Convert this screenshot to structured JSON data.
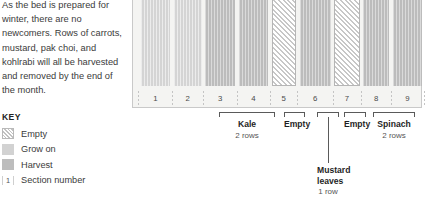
{
  "narrative": {
    "paragraph": "As the bed is prepared for winter, there are no newcomers. Rows of carrots, mustard, pak choi, and kohlrabi will all be harvested and removed by the end of the month."
  },
  "key": {
    "title": "KEY",
    "items": [
      {
        "swatch": "empty-swatch",
        "label": "Empty"
      },
      {
        "swatch": "grow-on-swatch",
        "label": "Grow on"
      },
      {
        "swatch": "harvest-swatch",
        "label": "Harvest"
      },
      {
        "swatch": "section-number-swatch",
        "sample": "1",
        "label": "Section number"
      }
    ]
  },
  "bed": {
    "sections": [
      {
        "number": "1",
        "state": "grow-on",
        "width": 11.6,
        "rows": 1
      },
      {
        "number": "2",
        "state": "grow-on",
        "width": 11.0,
        "rows": 1
      },
      {
        "number": "3",
        "state": "harvest",
        "width": 11.8,
        "rows": 1
      },
      {
        "number": "4",
        "state": "harvest",
        "width": 11.6,
        "rows": 1
      },
      {
        "number": "5",
        "state": "empty",
        "width": 9.6,
        "rows": 1
      },
      {
        "number": "6",
        "state": "harvest",
        "width": 12.4,
        "rows": 1
      },
      {
        "number": "7",
        "state": "empty",
        "width": 10.0,
        "rows": 1
      },
      {
        "number": "8",
        "state": "harvest",
        "width": 10.4,
        "rows": 1
      },
      {
        "number": "9",
        "state": "harvest",
        "width": 11.6,
        "rows": 1
      }
    ]
  },
  "brackets": [
    {
      "name": "kale",
      "label": "Kale",
      "sublabel": "2 rows",
      "left": 87,
      "width": 56,
      "drop": 0
    },
    {
      "name": "empty-left",
      "label": "Empty",
      "sublabel": "",
      "left": 152,
      "width": 21,
      "drop": 0
    },
    {
      "name": "mustard-leaves",
      "label": "Mustard leaves",
      "sublabel": "1 row",
      "left": 185,
      "width": 22,
      "drop": 46
    },
    {
      "name": "empty-right",
      "label": "Empty",
      "sublabel": "",
      "left": 212,
      "width": 22,
      "drop": 0
    },
    {
      "name": "spinach",
      "label": "Spinach",
      "sublabel": "2 rows",
      "left": 241,
      "width": 42,
      "drop": 0
    }
  ],
  "colors": {
    "grow_on": "#d4d4d4",
    "harvest": "#bcbcbc",
    "empty_hatch": "#c7c7c7",
    "frame": "#c9c9c9",
    "bed_background": "#f4f4f2",
    "text": "#333333"
  }
}
